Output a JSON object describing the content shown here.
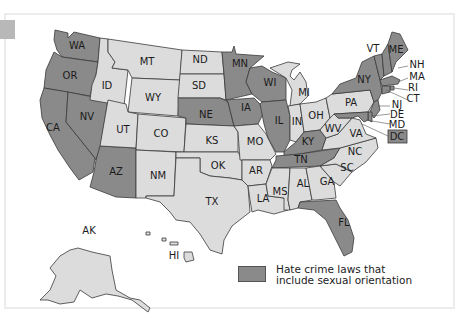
{
  "map": {
    "title": "",
    "colors": {
      "with_law": "#8a8a8a",
      "without_law": "#dcdcdc",
      "border": "#3a3a3a",
      "background": "#ffffff",
      "frame": "#ececec",
      "corner_tab": "#b8b8b8"
    },
    "legend": {
      "swatch_color": "#8a8a8a",
      "line1": "Hate crime laws that",
      "line2": "include sexual orientation"
    },
    "states": [
      {
        "abbr": "WA",
        "has_law": true
      },
      {
        "abbr": "OR",
        "has_law": true
      },
      {
        "abbr": "CA",
        "has_law": true
      },
      {
        "abbr": "NV",
        "has_law": true
      },
      {
        "abbr": "ID",
        "has_law": false
      },
      {
        "abbr": "MT",
        "has_law": false
      },
      {
        "abbr": "WY",
        "has_law": false
      },
      {
        "abbr": "UT",
        "has_law": false
      },
      {
        "abbr": "AZ",
        "has_law": true
      },
      {
        "abbr": "CO",
        "has_law": false
      },
      {
        "abbr": "NM",
        "has_law": false
      },
      {
        "abbr": "ND",
        "has_law": false
      },
      {
        "abbr": "SD",
        "has_law": false
      },
      {
        "abbr": "NE",
        "has_law": true
      },
      {
        "abbr": "KS",
        "has_law": false
      },
      {
        "abbr": "OK",
        "has_law": false
      },
      {
        "abbr": "TX",
        "has_law": false
      },
      {
        "abbr": "MN",
        "has_law": true
      },
      {
        "abbr": "IA",
        "has_law": true
      },
      {
        "abbr": "MO",
        "has_law": false
      },
      {
        "abbr": "AR",
        "has_law": false
      },
      {
        "abbr": "LA",
        "has_law": false
      },
      {
        "abbr": "WI",
        "has_law": true
      },
      {
        "abbr": "IL",
        "has_law": true
      },
      {
        "abbr": "MI",
        "has_law": false
      },
      {
        "abbr": "IN",
        "has_law": false
      },
      {
        "abbr": "OH",
        "has_law": false
      },
      {
        "abbr": "KY",
        "has_law": true
      },
      {
        "abbr": "TN",
        "has_law": true
      },
      {
        "abbr": "MS",
        "has_law": false
      },
      {
        "abbr": "AL",
        "has_law": false
      },
      {
        "abbr": "GA",
        "has_law": false
      },
      {
        "abbr": "FL",
        "has_law": true
      },
      {
        "abbr": "SC",
        "has_law": false
      },
      {
        "abbr": "NC",
        "has_law": false
      },
      {
        "abbr": "VA",
        "has_law": false
      },
      {
        "abbr": "WV",
        "has_law": false
      },
      {
        "abbr": "PA",
        "has_law": false
      },
      {
        "abbr": "NY",
        "has_law": true
      },
      {
        "abbr": "VT",
        "has_law": true
      },
      {
        "abbr": "NH",
        "has_law": true
      },
      {
        "abbr": "ME",
        "has_law": true
      },
      {
        "abbr": "MA",
        "has_law": true
      },
      {
        "abbr": "RI",
        "has_law": true
      },
      {
        "abbr": "CT",
        "has_law": true
      },
      {
        "abbr": "NJ",
        "has_law": true
      },
      {
        "abbr": "DE",
        "has_law": true
      },
      {
        "abbr": "MD",
        "has_law": true
      },
      {
        "abbr": "DC",
        "has_law": true
      },
      {
        "abbr": "AK",
        "has_law": false
      },
      {
        "abbr": "HI",
        "has_law": false
      }
    ],
    "labels": {
      "WA": "WA",
      "OR": "OR",
      "CA": "CA",
      "NV": "NV",
      "ID": "ID",
      "MT": "MT",
      "WY": "WY",
      "UT": "UT",
      "AZ": "AZ",
      "CO": "CO",
      "NM": "NM",
      "ND": "ND",
      "SD": "SD",
      "NE": "NE",
      "KS": "KS",
      "OK": "OK",
      "TX": "TX",
      "MN": "MN",
      "IA": "IA",
      "MO": "MO",
      "AR": "AR",
      "LA": "LA",
      "WI": "WI",
      "IL": "IL",
      "MI": "MI",
      "IN": "IN",
      "OH": "OH",
      "KY": "KY",
      "TN": "TN",
      "MS": "MS",
      "AL": "AL",
      "GA": "GA",
      "FL": "FL",
      "SC": "SC",
      "NC": "NC",
      "VA": "VA",
      "WV": "WV",
      "PA": "PA",
      "NY": "NY",
      "VT": "VT",
      "NH": "NH",
      "ME": "ME",
      "MA": "MA",
      "RI": "RI",
      "CT": "CT",
      "NJ": "NJ",
      "DE": "DE",
      "MD": "MD",
      "DC": "DC",
      "AK": "AK",
      "HI": "HI"
    }
  }
}
